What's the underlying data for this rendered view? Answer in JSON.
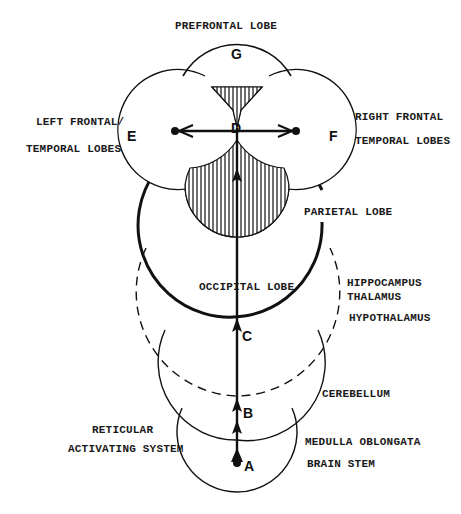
{
  "diagram": {
    "type": "brain-arousal-pathway",
    "labels": {
      "prefrontal": "PREFRONTAL LOBE",
      "left_frontal_1": "LEFT FRONTAL/",
      "left_frontal_2": "TEMPORAL LOBES",
      "right_frontal_1": "RIGHT FRONTAL",
      "right_frontal_2": "TEMPORAL LOBES",
      "parietal": "PARIETAL LOBE",
      "occipital": "OCCIPITAL LOBE",
      "hippocampus": "HIPPOCAMPUS",
      "thalamus": "THALAMUS",
      "hypothalamus": "HYPOTHALAMUS",
      "cerebellum": "CEREBELLUM",
      "reticular_1": "RETICULAR",
      "reticular_2": "ACTIVATING SYSTEM",
      "medulla": "MEDULLA OBLONGATA",
      "brain_stem": "BRAIN STEM"
    },
    "points": {
      "A": "A",
      "B": "B",
      "C": "C",
      "D": "D",
      "E": "E",
      "F": "F",
      "G": "G"
    },
    "colors": {
      "stroke": "#111111",
      "background": "#ffffff"
    }
  }
}
